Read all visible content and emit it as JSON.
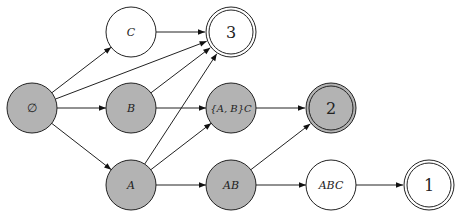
{
  "diagram": {
    "type": "directed-graph",
    "colors": {
      "shaded_fill": "#b3b3b3",
      "plain_fill": "#ffffff",
      "stroke": "#222222"
    },
    "nodes": [
      {
        "id": "empty",
        "label": "∅",
        "x": 32,
        "y": 108,
        "shaded": true,
        "double": false,
        "italic": false
      },
      {
        "id": "C",
        "label": "C",
        "x": 131,
        "y": 32,
        "shaded": false,
        "double": false,
        "italic": true
      },
      {
        "id": "three",
        "label": "3",
        "x": 231,
        "y": 32,
        "shaded": false,
        "double": true,
        "italic": false
      },
      {
        "id": "B",
        "label": "B",
        "x": 131,
        "y": 108,
        "shaded": true,
        "double": false,
        "italic": true
      },
      {
        "id": "ABC_set",
        "label": "{A, B}C",
        "x": 231,
        "y": 108,
        "shaded": true,
        "double": false,
        "italic": true
      },
      {
        "id": "two",
        "label": "2",
        "x": 331,
        "y": 108,
        "shaded": true,
        "double": true,
        "italic": false
      },
      {
        "id": "A",
        "label": "A",
        "x": 131,
        "y": 185,
        "shaded": true,
        "double": false,
        "italic": true
      },
      {
        "id": "AB",
        "label": "AB",
        "x": 231,
        "y": 185,
        "shaded": true,
        "double": false,
        "italic": true
      },
      {
        "id": "ABC",
        "label": "ABC",
        "x": 331,
        "y": 185,
        "shaded": false,
        "double": false,
        "italic": true
      },
      {
        "id": "one",
        "label": "1",
        "x": 429,
        "y": 185,
        "shaded": false,
        "double": true,
        "italic": false
      }
    ],
    "edges": [
      {
        "from": "empty",
        "to": "C"
      },
      {
        "from": "empty",
        "to": "three"
      },
      {
        "from": "empty",
        "to": "B"
      },
      {
        "from": "empty",
        "to": "A"
      },
      {
        "from": "C",
        "to": "three"
      },
      {
        "from": "B",
        "to": "three"
      },
      {
        "from": "A",
        "to": "three"
      },
      {
        "from": "B",
        "to": "ABC_set"
      },
      {
        "from": "A",
        "to": "ABC_set"
      },
      {
        "from": "A",
        "to": "AB"
      },
      {
        "from": "ABC_set",
        "to": "two"
      },
      {
        "from": "AB",
        "to": "two"
      },
      {
        "from": "AB",
        "to": "ABC"
      },
      {
        "from": "ABC",
        "to": "one"
      }
    ]
  }
}
